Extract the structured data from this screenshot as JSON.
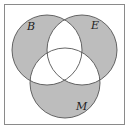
{
  "diagram": {
    "type": "venn",
    "frame": {
      "x": 4.5,
      "y": 4.5,
      "width": 120,
      "height": 120,
      "stroke": "#8a8a8a"
    },
    "sets": [
      {
        "name": "B",
        "label": "B",
        "cx": 47,
        "cy": 50,
        "r": 35,
        "label_x": 27,
        "label_y": 30
      },
      {
        "name": "E",
        "label": "E",
        "cx": 82,
        "cy": 50,
        "r": 35,
        "label_x": 91,
        "label_y": 29
      },
      {
        "name": "M",
        "label": "M",
        "cx": 65,
        "cy": 83,
        "r": 35,
        "label_x": 76,
        "label_y": 110
      }
    ],
    "shaded_regions": [
      "B only",
      "E only",
      "M only"
    ],
    "unshaded_regions": [
      "B∩E",
      "B∩M",
      "E∩M",
      "B∩E∩M",
      "outside"
    ],
    "shade_color": "#bdbdbd",
    "stroke_color": "#555555"
  }
}
